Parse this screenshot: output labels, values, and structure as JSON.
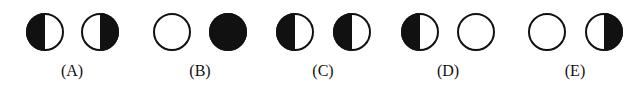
{
  "figure": {
    "colors": {
      "ink": "#111111",
      "paper": "#ffffff"
    },
    "circle_radius": 19,
    "center_y": 32,
    "options": [
      {
        "label": "(A)",
        "label_x": 72,
        "circles": [
          {
            "cx": 45,
            "phase": "left-half-dark"
          },
          {
            "cx": 100,
            "phase": "right-half-dark"
          }
        ]
      },
      {
        "label": "(B)",
        "label_x": 200,
        "circles": [
          {
            "cx": 172,
            "phase": "full-light"
          },
          {
            "cx": 228,
            "phase": "full-dark"
          }
        ]
      },
      {
        "label": "(C)",
        "label_x": 323,
        "circles": [
          {
            "cx": 295,
            "phase": "left-half-dark"
          },
          {
            "cx": 352,
            "phase": "left-half-dark"
          }
        ]
      },
      {
        "label": "(D)",
        "label_x": 448,
        "circles": [
          {
            "cx": 420,
            "phase": "left-half-dark"
          },
          {
            "cx": 476,
            "phase": "full-light"
          }
        ]
      },
      {
        "label": "(E)",
        "label_x": 575,
        "circles": [
          {
            "cx": 547,
            "phase": "full-light"
          },
          {
            "cx": 604,
            "phase": "right-half-dark"
          }
        ]
      }
    ]
  }
}
